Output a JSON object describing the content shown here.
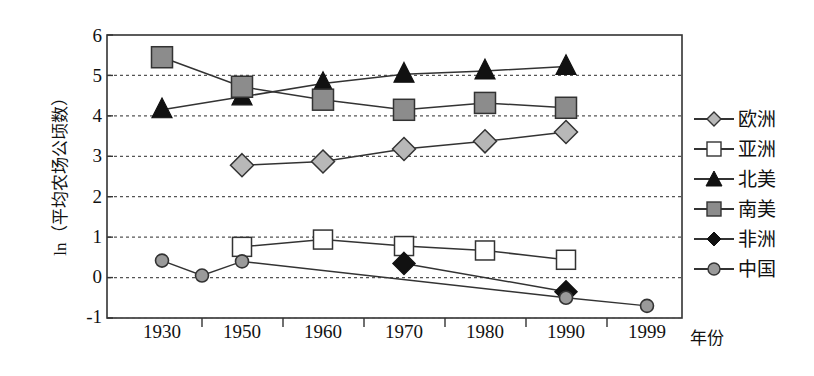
{
  "chart_data": {
    "type": "line",
    "title": "",
    "subtitle": "",
    "xlabel": "年份",
    "ylabel": "ln（平均农场公顷数）",
    "x": [
      1930,
      1940,
      1950,
      1960,
      1970,
      1980,
      1990,
      1999
    ],
    "xtick_labels": [
      "1930",
      "1950",
      "1960",
      "1970",
      "1980",
      "1990",
      "1999"
    ],
    "ytick_labels": [
      "6",
      "5",
      "4",
      "3",
      "2",
      "1",
      "0",
      "-1"
    ],
    "ylim": [
      -1,
      6
    ],
    "yticks": [
      -1,
      0,
      1,
      2,
      3,
      4,
      5,
      6
    ],
    "grid": "horizontal-dashed",
    "legend_position": "right",
    "series": [
      {
        "name": "欧洲",
        "marker": "diamond",
        "marker_fill": "#b8b8b8",
        "marker_edge": "#333333",
        "line_color": "#333333",
        "points": [
          {
            "x": 1950,
            "y": 2.78
          },
          {
            "x": 1960,
            "y": 2.87
          },
          {
            "x": 1970,
            "y": 3.18
          },
          {
            "x": 1980,
            "y": 3.37
          },
          {
            "x": 1990,
            "y": 3.6
          }
        ]
      },
      {
        "name": "亚洲",
        "marker": "square",
        "marker_fill": "#ffffff",
        "marker_edge": "#333333",
        "line_color": "#333333",
        "points": [
          {
            "x": 1950,
            "y": 0.76
          },
          {
            "x": 1960,
            "y": 0.94
          },
          {
            "x": 1970,
            "y": 0.78
          },
          {
            "x": 1980,
            "y": 0.67
          },
          {
            "x": 1990,
            "y": 0.44
          }
        ]
      },
      {
        "name": "北美",
        "marker": "triangle",
        "marker_fill": "#111111",
        "marker_edge": "#111111",
        "line_color": "#333333",
        "points": [
          {
            "x": 1930,
            "y": 4.15
          },
          {
            "x": 1950,
            "y": 4.47
          },
          {
            "x": 1960,
            "y": 4.8
          },
          {
            "x": 1970,
            "y": 5.03
          },
          {
            "x": 1980,
            "y": 5.11
          },
          {
            "x": 1990,
            "y": 5.22
          }
        ]
      },
      {
        "name": "南美",
        "marker": "square",
        "marker_fill": "#8c8c8c",
        "marker_edge": "#333333",
        "line_color": "#333333",
        "points": [
          {
            "x": 1930,
            "y": 5.45
          },
          {
            "x": 1950,
            "y": 4.72
          },
          {
            "x": 1960,
            "y": 4.4
          },
          {
            "x": 1970,
            "y": 4.15
          },
          {
            "x": 1980,
            "y": 4.32
          },
          {
            "x": 1990,
            "y": 4.2
          }
        ]
      },
      {
        "name": "非洲",
        "marker": "diamond",
        "marker_fill": "#111111",
        "marker_edge": "#111111",
        "line_color": "#333333",
        "points": [
          {
            "x": 1970,
            "y": 0.35
          },
          {
            "x": 1990,
            "y": -0.35
          }
        ]
      },
      {
        "name": "中国",
        "marker": "circle",
        "marker_fill": "#9a9a9a",
        "marker_edge": "#333333",
        "line_color": "#333333",
        "points": [
          {
            "x": 1930,
            "y": 0.42
          },
          {
            "x": 1940,
            "y": 0.05
          },
          {
            "x": 1950,
            "y": 0.4
          },
          {
            "x": 1990,
            "y": -0.5
          },
          {
            "x": 1999,
            "y": -0.7
          }
        ]
      }
    ]
  },
  "legend": {
    "items": [
      {
        "label": "欧洲"
      },
      {
        "label": "亚洲"
      },
      {
        "label": "北美"
      },
      {
        "label": "南美"
      },
      {
        "label": "非洲"
      },
      {
        "label": "中国"
      }
    ]
  },
  "axes": {
    "y_title": "ln（平均农场公顷数）",
    "x_title": "年份",
    "y_ticks": [
      "6",
      "5",
      "4",
      "3",
      "2",
      "1",
      "0",
      "-1"
    ],
    "x_ticks": [
      "1930",
      "1950",
      "1960",
      "1970",
      "1980",
      "1990",
      "1999"
    ]
  },
  "colors": {
    "axis": "#333333",
    "grid": "#555555",
    "line": "#333333",
    "south_america_fill": "#8c8c8c",
    "europe_fill": "#b8b8b8",
    "china_fill": "#9a9a9a",
    "asia_fill": "#ffffff",
    "north_america_fill": "#111111",
    "africa_fill": "#111111",
    "background": "#ffffff"
  }
}
